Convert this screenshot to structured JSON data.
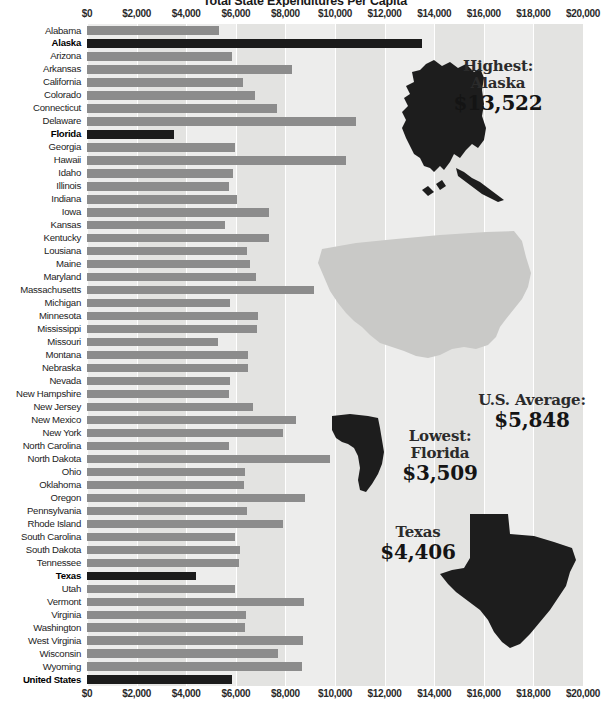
{
  "chart_data": {
    "type": "bar",
    "title": "Total State Expenditures Per Capita",
    "orientation": "horizontal",
    "xlabel": "",
    "ylabel": "",
    "xlim": [
      0,
      20000
    ],
    "grid": true,
    "legend_position": "none",
    "tick_labels": [
      "$0",
      "$2,000",
      "$4,000",
      "$6,000",
      "$8,000",
      "$10,000",
      "$12,000",
      "$14,000",
      "$16,000",
      "$18,000",
      "$20,000"
    ],
    "tick_values": [
      0,
      2000,
      4000,
      6000,
      8000,
      10000,
      12000,
      14000,
      16000,
      18000,
      20000
    ],
    "categories": [
      "Alabama",
      "Alaska",
      "Arizona",
      "Arkansas",
      "California",
      "Colorado",
      "Connecticut",
      "Delaware",
      "Florida",
      "Georgia",
      "Hawaii",
      "Idaho",
      "Illinois",
      "Indiana",
      "Iowa",
      "Kansas",
      "Kentucky",
      "Lousiana",
      "Maine",
      "Maryland",
      "Massachusetts",
      "Michigan",
      "Minnesota",
      "Mississippi",
      "Missouri",
      "Montana",
      "Nebraska",
      "Nevada",
      "New Hampshire",
      "New Jersey",
      "New Mexico",
      "New York",
      "North Carolina",
      "North Dakota",
      "Ohio",
      "Oklahoma",
      "Oregon",
      "Pennsylvania",
      "Rhode Island",
      "South Carolina",
      "South Dakota",
      "Tennessee",
      "Texas",
      "Utah",
      "Vermont",
      "Virginia",
      "Washington",
      "West Virginia",
      "Wisconsin",
      "Wyoming",
      "United States"
    ],
    "values": [
      5330,
      13522,
      5830,
      8260,
      6280,
      6760,
      7660,
      10850,
      3509,
      5970,
      10460,
      5880,
      5720,
      6030,
      7350,
      5570,
      7340,
      6460,
      6580,
      6830,
      9170,
      5780,
      6900,
      6870,
      5290,
      6500,
      6480,
      5750,
      5740,
      6680,
      8440,
      7890,
      5740,
      9790,
      6380,
      6330,
      8780,
      6440,
      7890,
      5950,
      6180,
      6130,
      4406,
      5980,
      8760,
      6420,
      6360,
      8720,
      7710,
      8680,
      5848
    ],
    "highlighted": [
      "Alaska",
      "Florida",
      "Texas",
      "United States"
    ]
  },
  "axis": {
    "top_labels": [
      "$0",
      "$2,000",
      "$4,000",
      "$6,000",
      "$8,000",
      "$10,000",
      "$12,000",
      "$14,000",
      "$16,000",
      "$18,000",
      "$20,000"
    ],
    "bottom_labels": [
      "$0",
      "$2,000",
      "$4,000",
      "$6,000",
      "$8,000",
      "$10,000",
      "$12,000",
      "$14,000",
      "$16,000",
      "$18,000",
      "$20,000"
    ]
  },
  "annotations": {
    "alaska": {
      "line1": "Highest:",
      "line2": "Alaska",
      "value": "$13,522"
    },
    "average": {
      "line1": "U.S. Average:",
      "line2": "",
      "value": "$5,848"
    },
    "florida": {
      "line1": "Lowest:",
      "line2": "Florida",
      "value": "$3,509"
    },
    "texas": {
      "line1": "Texas",
      "line2": "",
      "value": "$4,406"
    }
  },
  "maps": {
    "usa": "united-states-map",
    "alaska": "alaska-map",
    "florida": "florida-map",
    "texas": "texas-map"
  },
  "colors": {
    "bar": "#8c8c8c",
    "bar_highlight": "#1b1b1b",
    "plot_background": "#ededec",
    "band": "#e3e3e1",
    "gridline": "#ffffff",
    "usa_map": "#c9c9c7",
    "state_map": "#1d1d1d",
    "text": "#2b2b2b"
  },
  "footer": {
    "note": ""
  }
}
